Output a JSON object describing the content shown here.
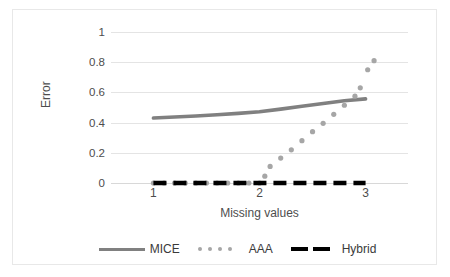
{
  "chart_data": {
    "type": "line",
    "title": "",
    "xlabel": "Missing values",
    "ylabel": "Error",
    "xlim": [
      0.6,
      3.4
    ],
    "ylim": [
      0,
      1
    ],
    "grid": true,
    "legend_position": "bottom",
    "y_ticks": [
      "0",
      "0.2",
      "0.4",
      "0.6",
      "0.8",
      "1"
    ],
    "y_tick_values": [
      0,
      0.2,
      0.4,
      0.6,
      0.8,
      1
    ],
    "x_ticks": [
      "1",
      "2",
      "3"
    ],
    "x_tick_values": [
      1,
      2,
      3
    ],
    "series": [
      {
        "name": "MICE",
        "style": "solid-line",
        "color": "#808080",
        "x": [
          1.0,
          1.2,
          1.4,
          1.6,
          1.8,
          2.0,
          2.2,
          2.4,
          2.6,
          2.8,
          3.0
        ],
        "values": [
          0.43,
          0.437,
          0.444,
          0.452,
          0.461,
          0.472,
          0.489,
          0.508,
          0.527,
          0.545,
          0.557
        ]
      },
      {
        "name": "AAA",
        "style": "dotted",
        "color": "#a6a6a6",
        "x": [
          1.0,
          1.1,
          1.2,
          1.3,
          1.4,
          1.5,
          1.6,
          1.7,
          1.8,
          1.9,
          2.0,
          2.05,
          2.1,
          2.2,
          2.3,
          2.4,
          2.5,
          2.6,
          2.7,
          2.8,
          2.9
        ],
        "values": [
          0.0,
          0.0,
          0.0,
          0.0,
          0.0,
          0.0,
          0.0,
          0.0,
          0.0,
          0.0,
          0.0,
          0.045,
          0.11,
          0.165,
          0.22,
          0.28,
          0.34,
          0.395,
          0.455,
          0.515,
          0.575
        ]
      },
      {
        "name": "AAA-upper",
        "style": "dotted",
        "color": "#a6a6a6",
        "x": [
          2.95,
          3.02,
          3.08
        ],
        "values": [
          0.63,
          0.75,
          0.81
        ]
      },
      {
        "name": "Hybrid",
        "style": "dashed",
        "color": "#000000",
        "x": [
          1.0,
          3.0
        ],
        "values": [
          0.0,
          0.0
        ]
      }
    ],
    "legend": [
      {
        "label": "MICE",
        "style": "solid-line",
        "color": "#808080"
      },
      {
        "label": "AAA",
        "style": "dotted",
        "color": "#a6a6a6"
      },
      {
        "label": "Hybrid",
        "style": "dashed",
        "color": "#000000"
      }
    ]
  }
}
